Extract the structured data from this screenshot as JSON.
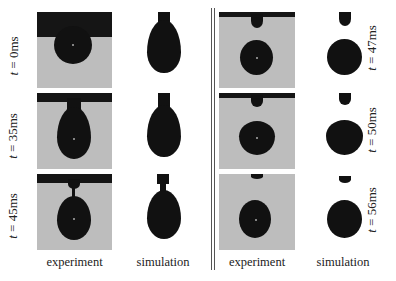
{
  "figure": {
    "column_labels": {
      "left_experiment": "experiment",
      "left_simulation": "simulation",
      "right_experiment": "experiment",
      "right_simulation": "simulation"
    },
    "left_rows": [
      {
        "t": "t",
        "eq": " = 0ms"
      },
      {
        "t": "t",
        "eq": " = 35ms"
      },
      {
        "t": "t",
        "eq": " = 45ms"
      }
    ],
    "right_rows": [
      {
        "t": "t",
        "eq": " = 47ms"
      },
      {
        "t": "t",
        "eq": " = 50ms"
      },
      {
        "t": "t",
        "eq": " = 56ms"
      }
    ],
    "colors": {
      "experiment_background": "#bdbdbd",
      "drop": "#111111",
      "divider": "#555555"
    }
  }
}
